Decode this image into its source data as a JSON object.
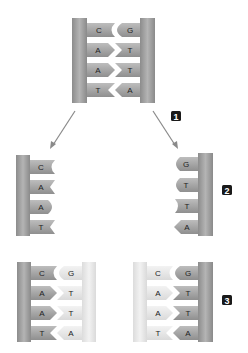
{
  "diagram": {
    "colors": {
      "backbone_dark": "#9a9a9a",
      "backbone_dark_edge": "#7a7a7a",
      "backbone_light": "#e4e4e4",
      "base_dark": "#a9a9a9",
      "base_light": "#e9e9e9",
      "arrow": "#888888",
      "label_bg": "#1a1a1a",
      "label_text": "#ffffff"
    },
    "parent": {
      "left_strand": [
        "C",
        "A",
        "A",
        "T"
      ],
      "right_strand": [
        "G",
        "T",
        "T",
        "A"
      ]
    },
    "separated": {
      "left_strand": [
        "C",
        "A",
        "A",
        "T"
      ],
      "right_strand": [
        "G",
        "T",
        "T",
        "A"
      ]
    },
    "daughters": {
      "left": {
        "old_strand": [
          "C",
          "A",
          "A",
          "T"
        ],
        "new_strand": [
          "G",
          "T",
          "T",
          "A"
        ]
      },
      "right": {
        "new_strand": [
          "C",
          "A",
          "A",
          "T"
        ],
        "old_strand": [
          "G",
          "T",
          "T",
          "A"
        ]
      }
    },
    "steps": [
      {
        "label": "1"
      },
      {
        "label": "2"
      },
      {
        "label": "3"
      }
    ]
  }
}
